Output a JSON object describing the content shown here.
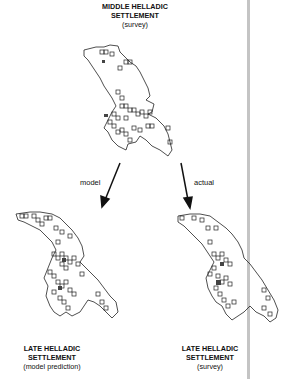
{
  "top": {
    "line1": "MIDDLE HELLADIC",
    "line2": "SETTLEMENT",
    "line3": "(survey)"
  },
  "arrows": {
    "left": "model",
    "right": "actual"
  },
  "bottom_left": {
    "line1": "LATE HELLADIC",
    "line2": "SETTLEMENT",
    "line3": "(model prediction)"
  },
  "bottom_right": {
    "line1": "LATE HELLADIC",
    "line2": "SETTLEMENT",
    "line3": "(survey)"
  },
  "colors": {
    "outline": "#222222",
    "divider": "#c4c4c4"
  }
}
